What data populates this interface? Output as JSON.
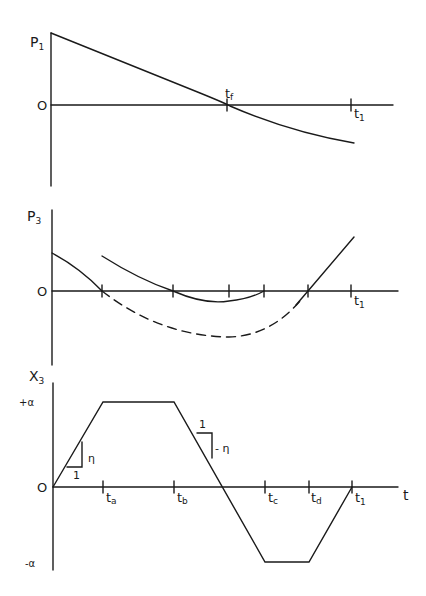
{
  "figure": {
    "panels": [
      {
        "id": "p1",
        "ylabel": "P",
        "ylabel_sub": "1",
        "zero_label": "O",
        "ticks": [
          {
            "label": "t",
            "sub": "f",
            "x": 227
          },
          {
            "label": "t",
            "sub": "1",
            "x": 351
          }
        ]
      },
      {
        "id": "p3",
        "ylabel": "P",
        "ylabel_sub": "3",
        "zero_label": "O",
        "ticks": [
          {
            "label": "t",
            "sub": "1",
            "x": 351
          }
        ]
      },
      {
        "id": "x3",
        "ylabel": "X",
        "ylabel_sub": "3",
        "zero_label": "O",
        "plus_alpha": "+α",
        "minus_alpha": "-α",
        "time_axis_label": "t",
        "slope_up_run": "1",
        "slope_up_rise": "η",
        "slope_down_run": "1",
        "slope_down_rise": "- η",
        "ticks": [
          {
            "label": "t",
            "sub": "a",
            "x": 103
          },
          {
            "label": "t",
            "sub": "b",
            "x": 174
          },
          {
            "label": "t",
            "sub": "c",
            "x": 265
          },
          {
            "label": "t",
            "sub": "d",
            "x": 309
          },
          {
            "label": "t",
            "sub": "1",
            "x": 352
          }
        ]
      }
    ]
  }
}
